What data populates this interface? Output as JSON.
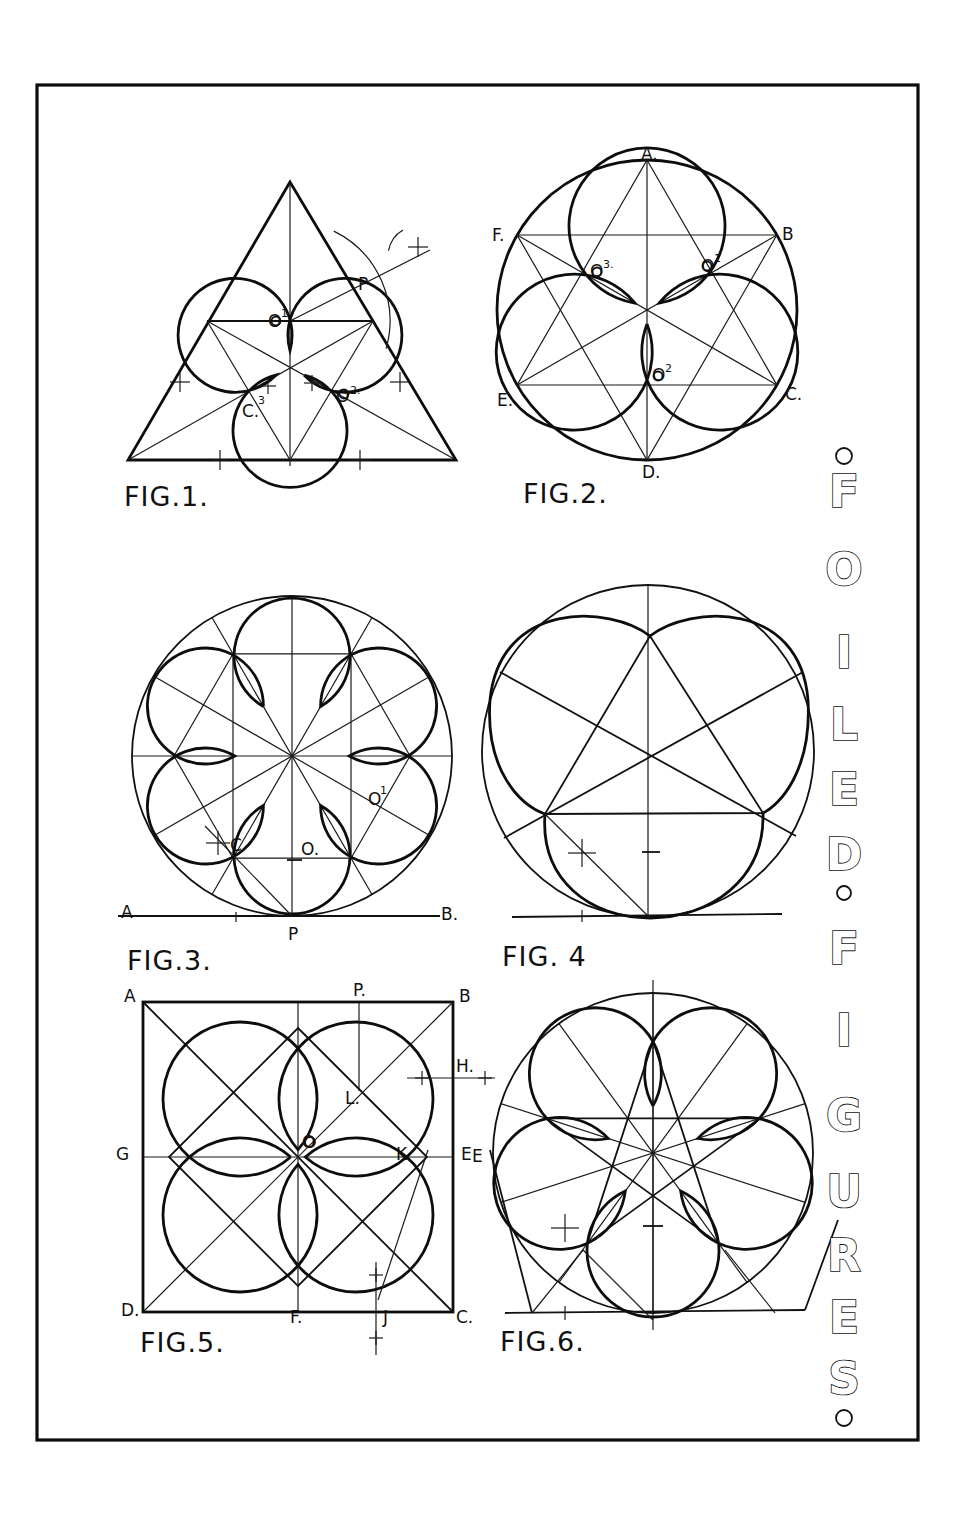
{
  "plate": {
    "title_letters": [
      "F",
      "O",
      "I",
      "L",
      "E",
      "D",
      "F",
      "I",
      "G",
      "U",
      "R",
      "E",
      "S"
    ],
    "title_words": [
      "FOILED",
      "FIGURES"
    ],
    "ink_color": "#111111",
    "paper_color": "#ffffff"
  },
  "figures": [
    {
      "id": "fig1",
      "caption": "FIG.1.",
      "description": "Trefoil inscribed in an equilateral triangle",
      "labels": {
        "o1": "O",
        "o1_sup": "1",
        "o2": "O",
        "o2_sup": "2.",
        "c3": "C.",
        "c3_sup": "3",
        "p": "P"
      }
    },
    {
      "id": "fig2",
      "caption": "FIG.2.",
      "description": "Trefoil inscribed in a circle with hexagram construction",
      "labels": {
        "a": "A.",
        "b": "B",
        "c": "C.",
        "d": "D.",
        "e": "E.",
        "f": "F.",
        "o1": "O",
        "o1_sup": "1",
        "o2": "O",
        "o2_sup": "2",
        "o3": "O",
        "o3_sup": "3."
      }
    },
    {
      "id": "fig3",
      "caption": "FIG.3.",
      "description": "Sexfoil inscribed in a circle tangent to line AB at P",
      "labels": {
        "a": "A",
        "b": "B.",
        "p": "P",
        "c": "C",
        "o": "O.",
        "o1": "O",
        "o1_sup": "1"
      }
    },
    {
      "id": "fig4",
      "caption": "FIG. 4",
      "description": "Trefoil with pentagram-like construction inside a circle"
    },
    {
      "id": "fig5",
      "caption": "FIG.5.",
      "description": "Quatrefoil inscribed in a square",
      "labels": {
        "a": "A",
        "b": "B",
        "c": "C.",
        "d": "D.",
        "e": "E",
        "f": "F.",
        "g": "G",
        "h": "H.",
        "j": "J",
        "k": "K",
        "l": "L.",
        "o": "O",
        "p": "P."
      }
    },
    {
      "id": "fig6",
      "caption": "FIG.6.",
      "description": "Cinquefoil inscribed in a circle with tangent construction",
      "labels": {
        "e": "E"
      }
    }
  ]
}
